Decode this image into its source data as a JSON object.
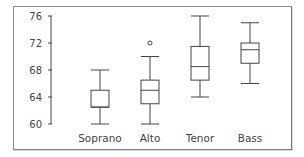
{
  "chart_data": {
    "type": "boxplot",
    "title": "",
    "xlabel": "",
    "ylabel": "",
    "ylim": [
      60,
      76
    ],
    "yticks": [
      60,
      64,
      68,
      72,
      76
    ],
    "categories": [
      "Soprano",
      "Alto",
      "Tenor",
      "Bass"
    ],
    "series": [
      {
        "name": "Soprano",
        "whisker_low": 60,
        "q1": 62.5,
        "median": 62.5,
        "q3": 65,
        "whisker_high": 68,
        "outliers": []
      },
      {
        "name": "Alto",
        "whisker_low": 60,
        "q1": 63,
        "median": 65,
        "q3": 66.5,
        "whisker_high": 70,
        "outliers": [
          72
        ]
      },
      {
        "name": "Tenor",
        "whisker_low": 64,
        "q1": 66.5,
        "median": 68.5,
        "q3": 71.5,
        "whisker_high": 76,
        "outliers": []
      },
      {
        "name": "Bass",
        "whisker_low": 66,
        "q1": 69,
        "median": 71,
        "q3": 72,
        "whisker_high": 75,
        "outliers": []
      }
    ],
    "grid": false,
    "legend": null
  },
  "axis": {
    "tick_labels": [
      "76",
      "72",
      "68",
      "64",
      "60"
    ]
  },
  "colors": {
    "stroke": "#444444",
    "frame": "#8a8a8a",
    "background": "#ffffff"
  }
}
